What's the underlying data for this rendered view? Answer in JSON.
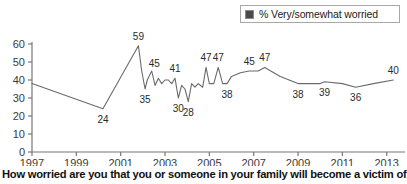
{
  "legend": {
    "label": "% Very/somewhat worried",
    "swatch_color": "#4a4a4a",
    "position": "top-right"
  },
  "caption": "How worried are you that you or someone in your family will become a victim of",
  "chart_data": {
    "type": "line",
    "title": "",
    "subtitle": "",
    "xlabel": "",
    "ylabel": "",
    "xlim": [
      1997,
      2013.6
    ],
    "ylim": [
      0,
      60
    ],
    "grid": false,
    "legend_position": "top-right",
    "series_name": "% Very/somewhat worried",
    "line_color": "#6b6b6b",
    "yticks": [
      0,
      10,
      20,
      30,
      40,
      50,
      60
    ],
    "ytick_labels": [
      "0",
      "10",
      "20",
      "30",
      "40",
      "50",
      "60"
    ],
    "xticks": [
      1997,
      1999,
      2001,
      2003,
      2005,
      2007,
      2009,
      2011,
      2013
    ],
    "xtick_labels": [
      "1997",
      "1999",
      "2001",
      "2003",
      "2005",
      "2007",
      "2009",
      "2011",
      "2013"
    ],
    "x": [
      1997.0,
      2000.2,
      2001.8,
      2001.95,
      2002.1,
      2002.2,
      2002.4,
      2002.55,
      2002.7,
      2002.85,
      2003.0,
      2003.15,
      2003.3,
      2003.45,
      2003.6,
      2003.75,
      2003.9,
      2004.05,
      2004.2,
      2004.35,
      2004.5,
      2004.7,
      2004.85,
      2005.0,
      2005.2,
      2005.4,
      2005.6,
      2005.8,
      2006.0,
      2006.4,
      2006.8,
      2007.2,
      2007.5,
      2008.2,
      2009.0,
      2010.0,
      2010.2,
      2011.0,
      2011.6,
      2012.4,
      2013.3
    ],
    "y": [
      38,
      24,
      59,
      45,
      35,
      40,
      45,
      37,
      41,
      38,
      40,
      40,
      38,
      41,
      30,
      37,
      35,
      28,
      38,
      36,
      38,
      36,
      47,
      38,
      38,
      47,
      38,
      38,
      42,
      44,
      45,
      45,
      47,
      42,
      38,
      38,
      39,
      38,
      36,
      38,
      40
    ],
    "labeled_points": [
      {
        "year": 2000.2,
        "value": 24,
        "label": "24",
        "label_pos": "below"
      },
      {
        "year": 2001.8,
        "value": 59,
        "label": "59",
        "label_pos": "above"
      },
      {
        "year": 2001.95,
        "value": 45,
        "label": "45",
        "label_pos": "above-right"
      },
      {
        "year": 2002.1,
        "value": 35,
        "label": "35",
        "label_pos": "below"
      },
      {
        "year": 2003.45,
        "value": 41,
        "label": "41",
        "label_pos": "above"
      },
      {
        "year": 2003.6,
        "value": 30,
        "label": "30",
        "label_pos": "below"
      },
      {
        "year": 2004.05,
        "value": 28,
        "label": "28",
        "label_pos": "below"
      },
      {
        "year": 2004.85,
        "value": 47,
        "label": "47",
        "label_pos": "above"
      },
      {
        "year": 2005.4,
        "value": 47,
        "label": "47",
        "label_pos": "above"
      },
      {
        "year": 2005.8,
        "value": 38,
        "label": "38",
        "label_pos": "below"
      },
      {
        "year": 2006.8,
        "value": 45,
        "label": "45",
        "label_pos": "above"
      },
      {
        "year": 2007.5,
        "value": 47,
        "label": "47",
        "label_pos": "above"
      },
      {
        "year": 2009.0,
        "value": 38,
        "label": "38",
        "label_pos": "below"
      },
      {
        "year": 2010.2,
        "value": 39,
        "label": "39",
        "label_pos": "below"
      },
      {
        "year": 2011.6,
        "value": 36,
        "label": "36",
        "label_pos": "below"
      },
      {
        "year": 2013.3,
        "value": 40,
        "label": "40",
        "label_pos": "above"
      }
    ]
  }
}
